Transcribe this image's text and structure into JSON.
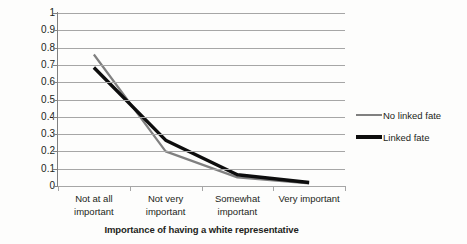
{
  "chart_data": {
    "type": "line",
    "title": "",
    "xlabel": "Importance of having a white representative",
    "ylabel": "Predicted probability",
    "categories": [
      "Not at all important",
      "Not very important",
      "Somewhat important",
      "Very important"
    ],
    "category_lines": [
      [
        "Not at all",
        "important"
      ],
      [
        "Not very",
        "important"
      ],
      [
        "Somewhat",
        "important"
      ],
      [
        "Very important",
        ""
      ]
    ],
    "series": [
      {
        "name": "No linked fate",
        "values": [
          0.76,
          0.2,
          0.05,
          0.015
        ],
        "color": "#808080",
        "width": 2.2
      },
      {
        "name": "Linked fate",
        "values": [
          0.685,
          0.265,
          0.065,
          0.02
        ],
        "color": "#0d0d0d",
        "width": 3.4
      }
    ],
    "ylim": [
      0,
      1
    ],
    "ytick_values": [
      0,
      0.1,
      0.2,
      0.3,
      0.4,
      0.5,
      0.6,
      0.7,
      0.8,
      0.9,
      1
    ],
    "ytick_labels": [
      "0",
      "0.1",
      "0.2",
      "0.3",
      "0.4",
      "0.5",
      "0.6",
      "0.7",
      "0.8",
      "0.9",
      "1"
    ],
    "grid": "horizontal",
    "legend_position": "right",
    "markers": false,
    "gridline_color": "#a6a6a6",
    "background": "#fdfdfc"
  }
}
